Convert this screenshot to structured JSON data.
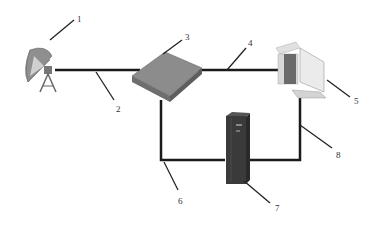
{
  "diagram": {
    "type": "network-topology",
    "components": [
      {
        "id": "1",
        "label": "1",
        "name": "satellite-dish"
      },
      {
        "id": "2",
        "label": "2",
        "name": "link-dish-to-router"
      },
      {
        "id": "3",
        "label": "3",
        "name": "router-box"
      },
      {
        "id": "4",
        "label": "4",
        "name": "link-router-to-computer"
      },
      {
        "id": "5",
        "label": "5",
        "name": "computer-workstation"
      },
      {
        "id": "6",
        "label": "6",
        "name": "link-router-to-server"
      },
      {
        "id": "7",
        "label": "7",
        "name": "server-tower"
      },
      {
        "id": "8",
        "label": "8",
        "name": "link-server-to-computer"
      }
    ],
    "colors": {
      "line": "#1a1a1a",
      "leader": "#222222",
      "router": "#8a8a8a",
      "server": "#3a3a3a",
      "dish": "#9a9a9a",
      "computer": "#c8c8c8"
    }
  }
}
